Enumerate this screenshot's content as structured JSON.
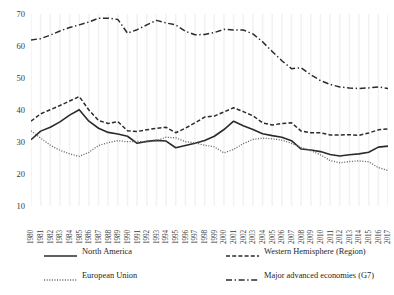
{
  "chart_data": {
    "type": "line",
    "title": "",
    "subtitle": "",
    "xlabel": "",
    "ylabel": "",
    "xlim": [
      1980,
      2017
    ],
    "ylim": [
      10,
      70
    ],
    "yticks": [
      10,
      20,
      30,
      40,
      50,
      60,
      70
    ],
    "grid": "vertical-only-faint",
    "legend_position": "bottom",
    "x": [
      1980,
      1981,
      1982,
      1983,
      1984,
      1985,
      1986,
      1987,
      1988,
      1989,
      1990,
      1991,
      1992,
      1993,
      1994,
      1995,
      1996,
      1997,
      1998,
      1999,
      2000,
      2001,
      2002,
      2003,
      2004,
      2005,
      2006,
      2007,
      2008,
      2009,
      2010,
      2011,
      2012,
      2013,
      2014,
      2015,
      2016,
      2017
    ],
    "categories": [
      "1980",
      "1981",
      "1982",
      "1983",
      "1984",
      "1985",
      "1986",
      "1987",
      "1988",
      "1989",
      "1990",
      "1991",
      "1992",
      "1993",
      "1994",
      "1995",
      "1996",
      "1997",
      "1998",
      "1999",
      "2000",
      "2001",
      "2002",
      "2003",
      "2004",
      "2005",
      "2006",
      "2007",
      "2008",
      "2009",
      "2010",
      "2011",
      "2012",
      "2013",
      "2014",
      "2015",
      "2016",
      "2017"
    ],
    "series": [
      {
        "name": "North America",
        "style": "solid",
        "color": "#2b2b2b",
        "values": [
          30.7,
          33.4,
          34.6,
          36.3,
          38.4,
          40.1,
          36.5,
          34.3,
          33.0,
          32.5,
          31.8,
          29.6,
          30.2,
          30.5,
          30.3,
          28.2,
          28.9,
          29.6,
          30.5,
          31.8,
          33.9,
          36.5,
          35.1,
          33.9,
          32.6,
          32.0,
          31.5,
          30.4,
          27.8,
          27.5,
          27.0,
          26.1,
          25.6,
          26.0,
          26.3,
          26.8,
          28.4,
          28.7
        ]
      },
      {
        "name": "Western Hemisphere (Region)",
        "style": "dashed",
        "color": "#2b2b2b",
        "values": [
          36.5,
          38.8,
          40.1,
          41.4,
          42.8,
          44.2,
          40.0,
          36.7,
          35.8,
          36.4,
          33.5,
          33.3,
          33.8,
          34.3,
          34.6,
          32.9,
          34.3,
          36.0,
          37.8,
          38.1,
          39.4,
          40.7,
          39.5,
          38.2,
          36.0,
          35.3,
          35.8,
          36.0,
          33.4,
          32.9,
          32.9,
          32.2,
          32.2,
          32.3,
          32.1,
          32.8,
          33.8,
          34.1
        ]
      },
      {
        "name": "European Union",
        "style": "dotted",
        "color": "#6b6b6b",
        "values": [
          33.5,
          31.2,
          29.0,
          27.4,
          26.3,
          25.5,
          26.8,
          28.9,
          29.8,
          30.4,
          30.1,
          30.2,
          30.0,
          30.4,
          31.5,
          31.3,
          30.1,
          29.7,
          29.0,
          28.5,
          26.6,
          27.7,
          29.5,
          30.8,
          31.2,
          31.0,
          30.6,
          29.6,
          28.3,
          27.3,
          26.0,
          24.2,
          23.5,
          23.9,
          24.1,
          23.8,
          22.0,
          21.1
        ]
      },
      {
        "name": "Major advanced economies (G7)",
        "style": "dashdot",
        "color": "#2b2b2b",
        "values": [
          61.9,
          62.3,
          63.4,
          64.7,
          65.8,
          66.6,
          67.5,
          68.7,
          68.7,
          68.3,
          64.0,
          65.1,
          66.6,
          68.0,
          67.2,
          66.6,
          64.6,
          63.5,
          63.6,
          64.2,
          65.2,
          65.0,
          65.0,
          63.8,
          61.3,
          58.3,
          55.4,
          52.9,
          53.2,
          51.0,
          49.2,
          48.0,
          47.2,
          46.9,
          46.7,
          46.9,
          47.2,
          46.7
        ]
      }
    ]
  },
  "legend": {
    "items": [
      {
        "label": "North America",
        "swatch": "legend-swatch-solid"
      },
      {
        "label": "Western Hemisphere (Region)",
        "swatch": "legend-swatch-dashed"
      },
      {
        "label": "European Union",
        "swatch": "legend-swatch-dotted"
      },
      {
        "label": "Major advanced economies (G7)",
        "swatch": "legend-swatch-dashdot"
      }
    ]
  }
}
